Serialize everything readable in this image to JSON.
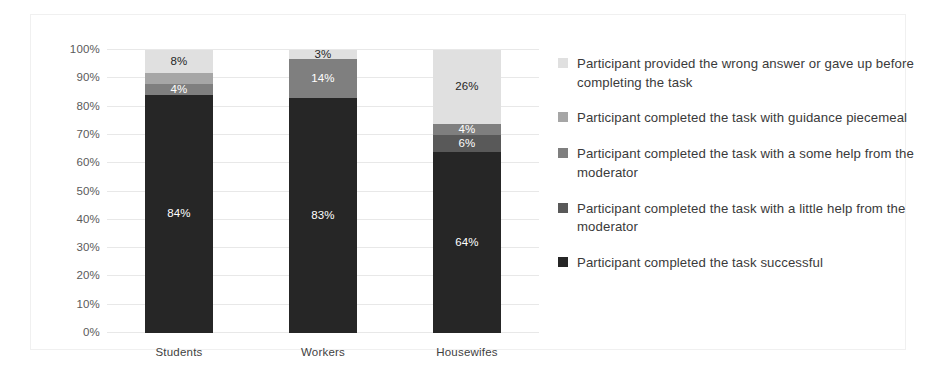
{
  "chart_data": {
    "type": "bar",
    "subtype": "100% stacked bar",
    "title": "",
    "xlabel": "",
    "ylabel": "",
    "ylim": [
      0,
      100
    ],
    "grid": true,
    "legend_position": "right",
    "categories": [
      "Students",
      "Workers",
      "Housewifes"
    ],
    "y_ticks": [
      "0%",
      "10%",
      "20%",
      "30%",
      "40%",
      "50%",
      "60%",
      "70%",
      "80%",
      "90%",
      "100%"
    ],
    "y_tick_values": [
      0,
      10,
      20,
      30,
      40,
      50,
      60,
      70,
      80,
      90,
      100
    ],
    "series": [
      {
        "name": "Participant completed the task successful",
        "color": "#262626",
        "label_color": "#ffffff",
        "values": [
          84,
          83,
          64
        ],
        "labels": [
          "84%",
          "83%",
          "64%"
        ]
      },
      {
        "name": "Participant completed the task with a little help from the moderator",
        "color": "#595959",
        "label_color": "#ffffff",
        "values": [
          0,
          0,
          6
        ],
        "labels": [
          "",
          "",
          "6%"
        ]
      },
      {
        "name": "Participant completed the task with a some help from the moderator",
        "color": "#7f7f7f",
        "label_color": "#ffffff",
        "values": [
          4,
          14,
          4
        ],
        "labels": [
          "4%",
          "14%",
          "4%"
        ]
      },
      {
        "name": "Participant completed the task with guidance piecemeal",
        "color": "#a6a6a6",
        "label_color": "#ffffff",
        "values": [
          4,
          0,
          0
        ],
        "labels": [
          "",
          "",
          ""
        ]
      },
      {
        "name": "Participant provided the wrong answer or gave up before completing the task",
        "color": "#e0e0e0",
        "label_color": "#262626",
        "values": [
          8,
          3,
          26
        ],
        "labels": [
          "8%",
          "3%",
          "26%"
        ]
      }
    ]
  },
  "legend": {
    "items": [
      {
        "label": "Participant provided the wrong answer or gave up before completing the task",
        "color": "#e0e0e0"
      },
      {
        "label": "Participant completed the task with guidance piecemeal",
        "color": "#a6a6a6"
      },
      {
        "label": "Participant completed the task with a some help from the moderator",
        "color": "#7f7f7f"
      },
      {
        "label": "Participant completed the task with a little help from the moderator",
        "color": "#595959"
      },
      {
        "label": "Participant completed the task successful",
        "color": "#262626"
      }
    ]
  }
}
